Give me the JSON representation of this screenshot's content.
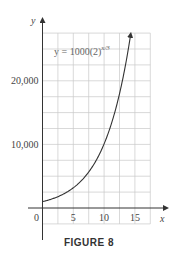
{
  "figure": {
    "caption": "FIGURE 8"
  },
  "chart_data": {
    "type": "line",
    "title": "",
    "xlabel": "x",
    "ylabel": "y",
    "annotation": "y = 1000(2)^{x/3}",
    "equation_text": {
      "base": "y = 1000(2)",
      "exponent": "x/3"
    },
    "xlim": [
      -2.5,
      17.5
    ],
    "ylim": [
      -3750,
      28750
    ],
    "x_ticks": [
      0,
      5,
      10,
      15
    ],
    "x_tick_labels": [
      "0",
      "5",
      "10",
      "15"
    ],
    "y_ticks": [
      10000,
      20000
    ],
    "y_tick_labels": [
      "10,000",
      "20,000"
    ],
    "grid": true,
    "grid_x_step": 2.5,
    "grid_y_step": 2500,
    "legend": null,
    "series": [
      {
        "name": "y = 1000(2)^{x/3}",
        "x": [
          0,
          1,
          2,
          3,
          4,
          5,
          6,
          7,
          8,
          9,
          10,
          11,
          12,
          13,
          14,
          14.3
        ],
        "values": [
          1000,
          1260,
          1587,
          2000,
          2520,
          3175,
          4000,
          5040,
          6350,
          8000,
          10079,
          12699,
          16000,
          20159,
          25398,
          27200
        ]
      }
    ]
  }
}
